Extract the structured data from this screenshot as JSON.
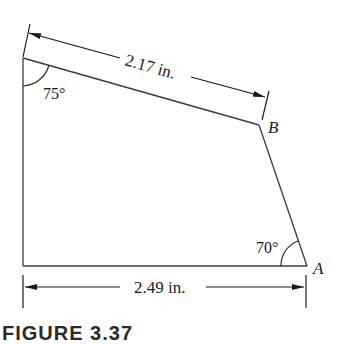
{
  "figure": {
    "caption": "FIGURE 3.37",
    "dimensions": {
      "top": "2.17 in.",
      "bottom": "2.49 in."
    },
    "angles": {
      "top_left": "75°",
      "bottom_right": "70°"
    },
    "points": {
      "A": "A",
      "B": "B"
    },
    "colors": {
      "line": "#3a3a3a",
      "text": "#1a1a1a",
      "background": "#ffffff"
    }
  }
}
